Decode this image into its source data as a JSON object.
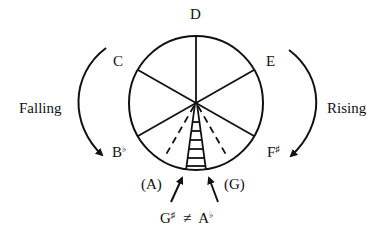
{
  "diagram": {
    "notes": {
      "top": "D",
      "upper_left": "C",
      "upper_right": "E",
      "lower_left": {
        "letter": "B",
        "accidental": "♭"
      },
      "lower_right": {
        "letter": "F",
        "accidental": "♯"
      },
      "bottom_left": "(A)",
      "bottom_right": "(G)"
    },
    "directions": {
      "left": "Falling",
      "right": "Rising"
    },
    "enharmonic": {
      "left": {
        "letter": "G",
        "accidental": "♯"
      },
      "relation": "≠",
      "right": {
        "letter": "A",
        "accidental": "♭"
      }
    },
    "colors": {
      "ink": "#111111",
      "background": "#ffffff"
    }
  }
}
